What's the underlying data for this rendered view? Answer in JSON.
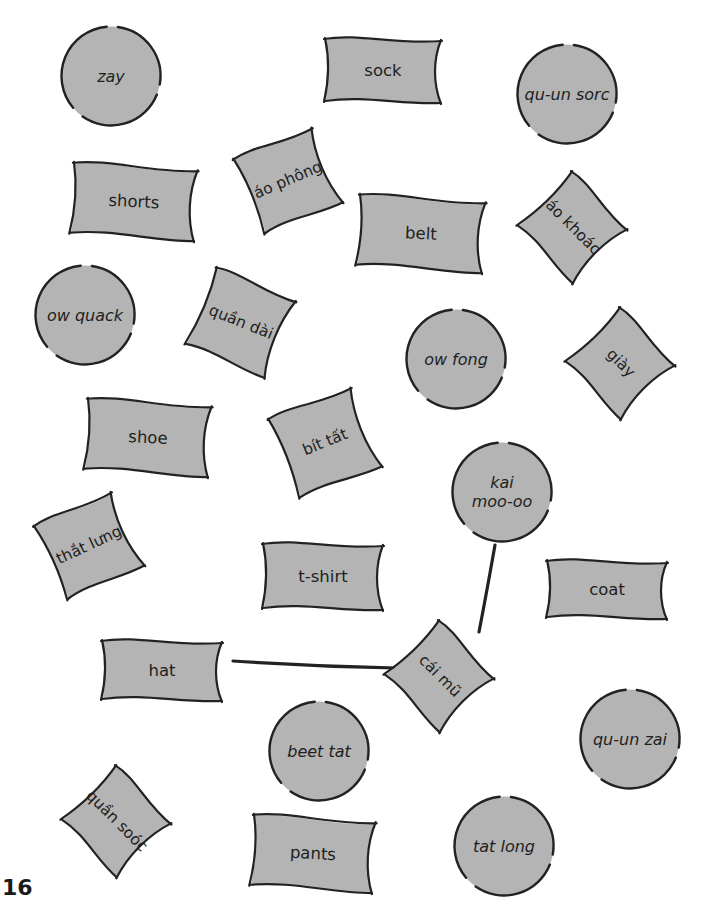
{
  "page": {
    "number": "16",
    "colors": {
      "card_fill": "#b4b4b4",
      "outline": "#222222",
      "background": "#ffffff"
    }
  },
  "cards": [
    {
      "id": "zay",
      "text": "zay",
      "kind": "pron",
      "shape": "circle",
      "x": 60,
      "y": 25,
      "w": 102,
      "h": 102,
      "rot": 0
    },
    {
      "id": "sock",
      "text": "sock",
      "kind": "en",
      "shape": "rect",
      "x": 324,
      "y": 36,
      "w": 118,
      "h": 68,
      "rot": 0
    },
    {
      "id": "qu-un-sorc",
      "text": "qu-un sorc",
      "kind": "pron",
      "shape": "circle",
      "x": 516,
      "y": 43,
      "w": 102,
      "h": 102,
      "rot": 0
    },
    {
      "id": "shorts",
      "text": "shorts",
      "kind": "en",
      "shape": "rect",
      "x": 71,
      "y": 163,
      "w": 126,
      "h": 76,
      "rot": 3
    },
    {
      "id": "ao-phong",
      "text": "áo phông",
      "kind": "vi",
      "shape": "rect",
      "x": 245,
      "y": 137,
      "w": 86,
      "h": 86,
      "rot": -23
    },
    {
      "id": "belt",
      "text": "belt",
      "kind": "en",
      "shape": "rect",
      "x": 357,
      "y": 195,
      "w": 128,
      "h": 76,
      "rot": 3
    },
    {
      "id": "ao-khoac",
      "text": "áo khoác",
      "kind": "vi",
      "shape": "rect",
      "x": 532,
      "y": 186,
      "w": 82,
      "h": 82,
      "rot": 45
    },
    {
      "id": "ow-quack",
      "text": "ow quack",
      "kind": "pron",
      "shape": "circle",
      "x": 34,
      "y": 264,
      "w": 102,
      "h": 102,
      "rot": 0
    },
    {
      "id": "quan-dai",
      "text": "quần dài",
      "kind": "vi",
      "shape": "rect",
      "x": 197,
      "y": 278,
      "w": 88,
      "h": 88,
      "rot": 22
    },
    {
      "id": "ow-fong",
      "text": "ow fong",
      "kind": "pron",
      "shape": "circle",
      "x": 405,
      "y": 308,
      "w": 102,
      "h": 102,
      "rot": 0
    },
    {
      "id": "giay",
      "text": "giày",
      "kind": "vi",
      "shape": "rect",
      "x": 580,
      "y": 322,
      "w": 82,
      "h": 82,
      "rot": 45
    },
    {
      "id": "shoe",
      "text": "shoe",
      "kind": "en",
      "shape": "rect",
      "x": 85,
      "y": 399,
      "w": 126,
      "h": 76,
      "rot": 3
    },
    {
      "id": "bit-tat",
      "text": "bít tất",
      "kind": "vi",
      "shape": "rect",
      "x": 280,
      "y": 397,
      "w": 90,
      "h": 90,
      "rot": -22
    },
    {
      "id": "kai-moo-oo",
      "text": "kai\nmoo-oo",
      "kind": "pron",
      "shape": "circle",
      "x": 451,
      "y": 441,
      "w": 102,
      "h": 102,
      "rot": 0
    },
    {
      "id": "that-lung",
      "text": "thắt lưng",
      "kind": "vi",
      "shape": "rect",
      "x": 46,
      "y": 502,
      "w": 86,
      "h": 86,
      "rot": -25
    },
    {
      "id": "t-shirt",
      "text": "t-shirt",
      "kind": "en",
      "shape": "rect",
      "x": 262,
      "y": 541,
      "w": 122,
      "h": 70,
      "rot": 0
    },
    {
      "id": "coat",
      "text": "coat",
      "kind": "en",
      "shape": "rect",
      "x": 546,
      "y": 558,
      "w": 122,
      "h": 62,
      "rot": 0
    },
    {
      "id": "hat",
      "text": "hat",
      "kind": "en",
      "shape": "rect",
      "x": 101,
      "y": 638,
      "w": 122,
      "h": 64,
      "rot": 0
    },
    {
      "id": "cai-mu",
      "text": "cái mũ",
      "kind": "vi",
      "shape": "rect",
      "x": 399,
      "y": 635,
      "w": 82,
      "h": 82,
      "rot": 45
    },
    {
      "id": "qu-un-zai",
      "text": "qu-un zai",
      "kind": "pron",
      "shape": "circle",
      "x": 579,
      "y": 688,
      "w": 102,
      "h": 102,
      "rot": 0
    },
    {
      "id": "beet-tat",
      "text": "beet tat",
      "kind": "pron",
      "shape": "circle",
      "x": 268,
      "y": 700,
      "w": 102,
      "h": 102,
      "rot": 0
    },
    {
      "id": "quan-sooc",
      "text": "quần soóc",
      "kind": "vi",
      "shape": "rect",
      "x": 76,
      "y": 780,
      "w": 82,
      "h": 82,
      "rot": 45
    },
    {
      "id": "pants",
      "text": "pants",
      "kind": "en",
      "shape": "rect",
      "x": 251,
      "y": 815,
      "w": 124,
      "h": 76,
      "rot": 3
    },
    {
      "id": "tat-long",
      "text": "tat long",
      "kind": "pron",
      "shape": "circle",
      "x": 453,
      "y": 795,
      "w": 102,
      "h": 102,
      "rot": 0
    }
  ],
  "connections": [
    {
      "from": "hat",
      "to": "cai-mu",
      "x1": 233,
      "y1": 661,
      "x2": 396,
      "y2": 668
    },
    {
      "from": "kai-moo-oo",
      "to": "cai-mu",
      "x1": 495,
      "y1": 545,
      "x2": 479,
      "y2": 632
    }
  ]
}
